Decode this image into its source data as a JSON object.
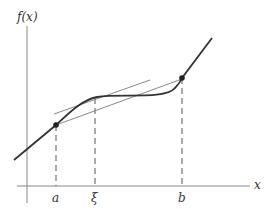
{
  "diagram": {
    "y_axis_label": "f(x)",
    "x_axis_label": "x",
    "tick_labels": {
      "a": "a",
      "xi": "ξ",
      "b": "b"
    },
    "points": [
      {
        "name": "a",
        "label": "a"
      },
      {
        "name": "b",
        "label": "b"
      }
    ],
    "colors": {
      "curve": "#333333",
      "axis": "#777777",
      "tangent": "#777777",
      "secant": "#777777",
      "dashed": "#555555"
    }
  }
}
